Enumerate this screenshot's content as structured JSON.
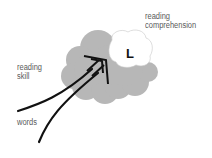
{
  "diagram": {
    "labels": {
      "comprehension_line1": "reading",
      "comprehension_line2": "comprehension",
      "skill_line1": "reading",
      "skill_line2": "skill",
      "words": "words",
      "region": "L"
    },
    "colors": {
      "brain": "#b7b7b7",
      "region": "#ffffff",
      "arrow": "#111111",
      "text": "#5a5a5a"
    }
  }
}
